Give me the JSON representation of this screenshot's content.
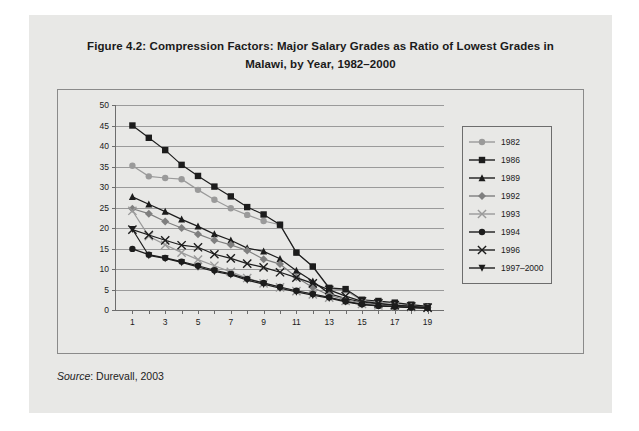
{
  "figure": {
    "title": "Figure 4.2: Compression Factors: Major Salary Grades as Ratio of Lowest Grades in Malawi, by Year, 1982–2000",
    "source_label": "Source",
    "source_text": ": Durevall, 2003"
  },
  "chart_data": {
    "type": "line",
    "title": "Figure 4.2: Compression Factors: Major Salary Grades as Ratio of Lowest Grades in Malawi, by Year, 1982–2000",
    "xlabel": "",
    "ylabel": "",
    "xlim": [
      0,
      20
    ],
    "ylim": [
      0,
      50
    ],
    "grid": true,
    "legend_position": "right",
    "x": [
      1,
      2,
      3,
      4,
      5,
      6,
      7,
      8,
      9,
      10,
      11,
      12,
      13,
      14,
      15,
      16,
      17,
      18,
      19
    ],
    "xticks": [
      1,
      3,
      5,
      7,
      9,
      11,
      13,
      15,
      17,
      19
    ],
    "yticks": [
      0,
      5,
      10,
      15,
      20,
      25,
      30,
      35,
      40,
      45,
      50
    ],
    "series": [
      {
        "name": "1982",
        "color": "#9a9a9a",
        "marker": "circle",
        "values": [
          35.2,
          32.6,
          32.2,
          31.9,
          29.3,
          26.9,
          24.8,
          23.2,
          21.7,
          20.8,
          14.0,
          10.6,
          5.2,
          4.8,
          2.3,
          2.0,
          1.6,
          1.2,
          0.8
        ]
      },
      {
        "name": "1986",
        "color": "#1c1c1c",
        "marker": "square",
        "values": [
          45.0,
          42.0,
          39.0,
          35.4,
          32.7,
          30.1,
          27.7,
          25.1,
          23.3,
          20.8,
          14.0,
          10.6,
          5.4,
          5.1,
          2.5,
          2.2,
          1.8,
          1.3,
          0.9
        ]
      },
      {
        "name": "1989",
        "color": "#1c1c1c",
        "marker": "triangle-up",
        "values": [
          27.6,
          25.8,
          24.0,
          22.1,
          20.4,
          18.5,
          17.0,
          15.1,
          14.3,
          12.5,
          9.6,
          7.0,
          4.0,
          2.8,
          1.9,
          1.5,
          1.2,
          0.9,
          0.6
        ]
      },
      {
        "name": "1992",
        "color": "#7f7f7f",
        "marker": "diamond",
        "values": [
          24.7,
          23.5,
          21.6,
          20.0,
          18.5,
          17.0,
          15.9,
          14.5,
          12.4,
          11.2,
          8.0,
          5.5,
          3.6,
          2.5,
          1.7,
          1.3,
          1.0,
          0.8,
          0.6
        ]
      },
      {
        "name": "1993",
        "color": "#9a9a9a",
        "marker": "star",
        "values": [
          24.2,
          18.0,
          15.9,
          14.0,
          12.3,
          10.8,
          9.3,
          7.8,
          6.5,
          5.5,
          4.6,
          3.8,
          3.0,
          2.2,
          1.5,
          1.1,
          0.9,
          0.7,
          0.5
        ]
      },
      {
        "name": "1994",
        "color": "#1c1c1c",
        "marker": "circle",
        "values": [
          14.9,
          13.5,
          12.7,
          11.8,
          10.8,
          9.7,
          8.8,
          7.6,
          6.6,
          5.6,
          4.7,
          3.9,
          3.1,
          2.1,
          1.4,
          1.0,
          0.8,
          0.6,
          0.5
        ]
      },
      {
        "name": "1996",
        "color": "#1c1c1c",
        "marker": "cross",
        "values": [
          19.6,
          18.3,
          17.0,
          15.8,
          15.3,
          13.6,
          12.6,
          11.3,
          10.4,
          9.2,
          7.9,
          6.5,
          4.9,
          3.4,
          2.1,
          1.6,
          1.2,
          0.9,
          0.6
        ]
      },
      {
        "name": "1997–2000",
        "color": "#1c1c1c",
        "marker": "triangle-down",
        "values": [
          19.7,
          13.3,
          12.6,
          11.6,
          10.5,
          9.4,
          8.6,
          7.3,
          6.3,
          5.3,
          4.4,
          3.6,
          2.9,
          2.0,
          1.3,
          1.0,
          0.8,
          0.6,
          0.4
        ]
      }
    ]
  }
}
